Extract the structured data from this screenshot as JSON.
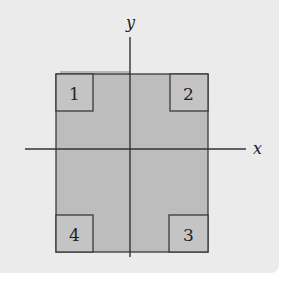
{
  "diagram": {
    "axes": {
      "x_label": "x",
      "y_label": "y"
    },
    "square": {
      "fill": "#bdbdbd",
      "stroke": "#3a3a3a"
    },
    "corners": [
      {
        "id": 1,
        "label": "1",
        "position": "top-left"
      },
      {
        "id": 2,
        "label": "2",
        "position": "top-right"
      },
      {
        "id": 3,
        "label": "3",
        "position": "bottom-right"
      },
      {
        "id": 4,
        "label": "4",
        "position": "bottom-left"
      }
    ],
    "colors": {
      "background": "#ebebeb",
      "corner_fill": "#c4c4c4",
      "line": "#333333"
    }
  }
}
